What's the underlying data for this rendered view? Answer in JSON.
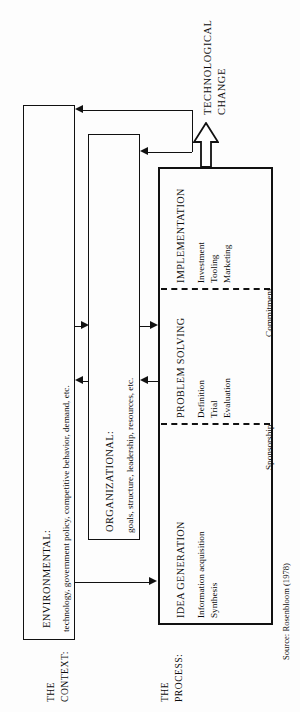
{
  "figure": {
    "source_note": "Source: Rosenbloom (1978)",
    "outcome_label_line1": "TECHNOLOGICAL",
    "outcome_label_line2": "CHANGE"
  },
  "side_labels": {
    "context": {
      "line1": "THE",
      "line2": "CONTEXT:"
    },
    "process": {
      "line1": "THE",
      "line2": "PROCESS:"
    }
  },
  "context": {
    "boxes": [
      {
        "id": "environmental",
        "title": "ENVIRONMENTAL:",
        "detail": "technology, government policy, competitive behavior, demand, etc."
      },
      {
        "id": "organizational",
        "title": "ORGANIZATIONAL:",
        "detail": "goals, structure, leadership, resources, etc."
      }
    ]
  },
  "process": {
    "stages": [
      {
        "id": "idea-generation",
        "title": "IDEA GENERATION",
        "items": [
          "Information acquisition",
          "Synthesis"
        ]
      },
      {
        "id": "problem-solving",
        "title": "PROBLEM SOLVING",
        "items": [
          "Definition",
          "Trial",
          "Evaluation"
        ]
      },
      {
        "id": "implementation",
        "title": "IMPLEMENTATION",
        "items": [
          "Investment",
          "Tooling",
          "Marketing"
        ]
      }
    ],
    "gates": [
      {
        "id": "sponsorship",
        "label": "Sponsorship"
      },
      {
        "id": "commitment",
        "label": "Commitment"
      }
    ]
  },
  "colors": {
    "ink": "#111111",
    "paper": "#fdfdfd"
  }
}
